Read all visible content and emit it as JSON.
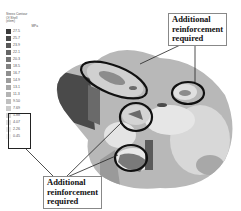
{
  "figure": {
    "legend": {
      "title_lines": [
        "Stress Contour",
        "Of Shell",
        "(elem)"
      ],
      "units": "MPa",
      "entries": [
        {
          "label": "27.5",
          "color": "#3a3a3a"
        },
        {
          "label": "25.7",
          "color": "#4a4a4a"
        },
        {
          "label": "23.9",
          "color": "#585858"
        },
        {
          "label": "22.1",
          "color": "#666666"
        },
        {
          "label": "20.3",
          "color": "#747474"
        },
        {
          "label": "18.5",
          "color": "#828282"
        },
        {
          "label": "16.7",
          "color": "#8f8f8f"
        },
        {
          "label": "14.9",
          "color": "#9c9c9c"
        },
        {
          "label": "13.1",
          "color": "#a8a8a8"
        },
        {
          "label": "11.3",
          "color": "#b4b4b4"
        },
        {
          "label": "9.50",
          "color": "#c0c0c0"
        },
        {
          "label": "7.69",
          "color": "#cbcbcb"
        },
        {
          "label": "5.88",
          "color": "#d6d6d6"
        },
        {
          "label": "4.07",
          "color": "#e0e0e0"
        },
        {
          "label": "2.26",
          "color": "#e9e9e9"
        },
        {
          "label": "0.45",
          "color": "#f2f2f2"
        }
      ]
    },
    "callouts": {
      "top": "Additional\nreinforcement\nrequired",
      "bottom": "Additional\nreinforcement\nrequired"
    }
  }
}
